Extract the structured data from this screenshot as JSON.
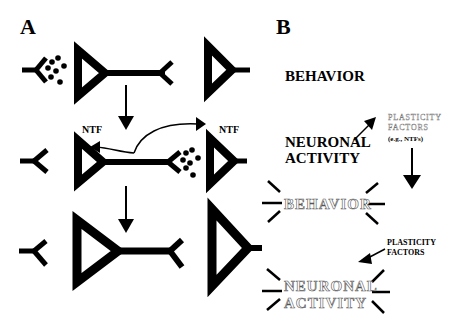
{
  "panels": {
    "a": {
      "label": "A",
      "ntf_left": "NTF",
      "ntf_right": "NTF"
    },
    "b": {
      "label": "B",
      "top": {
        "behavior": "BEHAVIOR",
        "neuronal_line1": "NEURONAL",
        "neuronal_line2": "ACTIVITY",
        "plasticity_line1": "PLASTICITY",
        "plasticity_line2": "FACTORS",
        "plasticity_line3": "(e.g., NTFs)"
      },
      "bottom": {
        "behavior": "BEHAVIOR",
        "plasticity_line1": "PLASTICITY",
        "plasticity_line2": "FACTORS",
        "neuronal_line1": "NEURONAL",
        "neuronal_line2": "ACTIVITY"
      }
    }
  },
  "colors": {
    "ink": "#000000",
    "background": "#ffffff",
    "outline_text": "#555555"
  }
}
